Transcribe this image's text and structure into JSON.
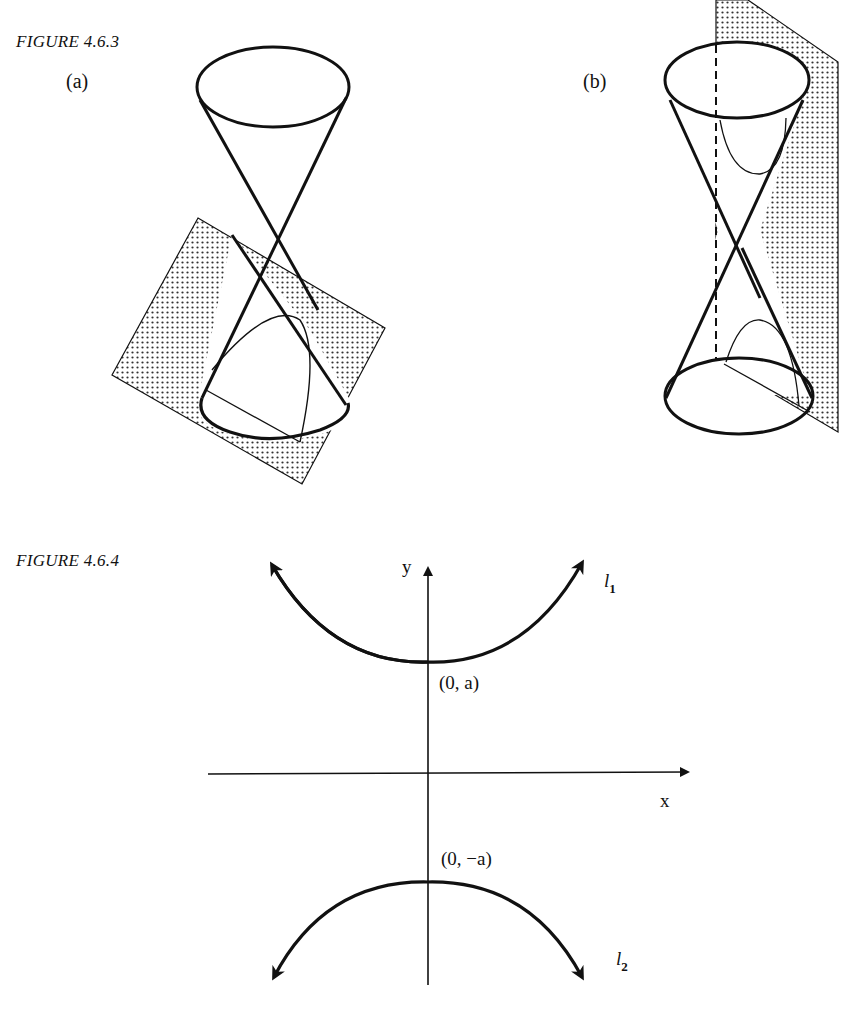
{
  "figures": [
    {
      "caption": "FIGURE 4.6.3",
      "panels": [
        {
          "label": "(a)",
          "description": "Double cone cut by an inclined plane, intersection is a parabola"
        },
        {
          "label": "(b)",
          "description": "Double cone cut by a vertical plane parallel to the axis, intersection is a hyperbola with two branches"
        }
      ]
    },
    {
      "caption": "FIGURE 4.6.4",
      "axes": {
        "x_label": "x",
        "y_label": "y"
      },
      "points": [
        {
          "label": "(0, a)"
        },
        {
          "label": "(0, −a)"
        }
      ],
      "curves": [
        {
          "name": "l",
          "subscript": "1"
        },
        {
          "name": "l",
          "subscript": "2"
        }
      ]
    }
  ],
  "colors": {
    "ink": "#111111",
    "paper": "#ffffff",
    "stipple": "#333333"
  }
}
